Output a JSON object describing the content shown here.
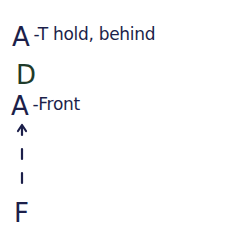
{
  "lines": [
    {
      "letter": "A",
      "note": "-T hold, behind",
      "color": "#1c1f4a"
    },
    {
      "letter": "D",
      "note": "",
      "color": "#1f3b2a"
    },
    {
      "letter": "A",
      "note": "-Front",
      "color": "#1c1f4a"
    }
  ],
  "arrow": {
    "direction": "up",
    "style": "dashed",
    "from": "F",
    "to": "A"
  },
  "bottom_letter": "F",
  "colors": {
    "ink": "#1c1f4a",
    "green_ink": "#1f3b2a",
    "background": "#ffffff"
  }
}
